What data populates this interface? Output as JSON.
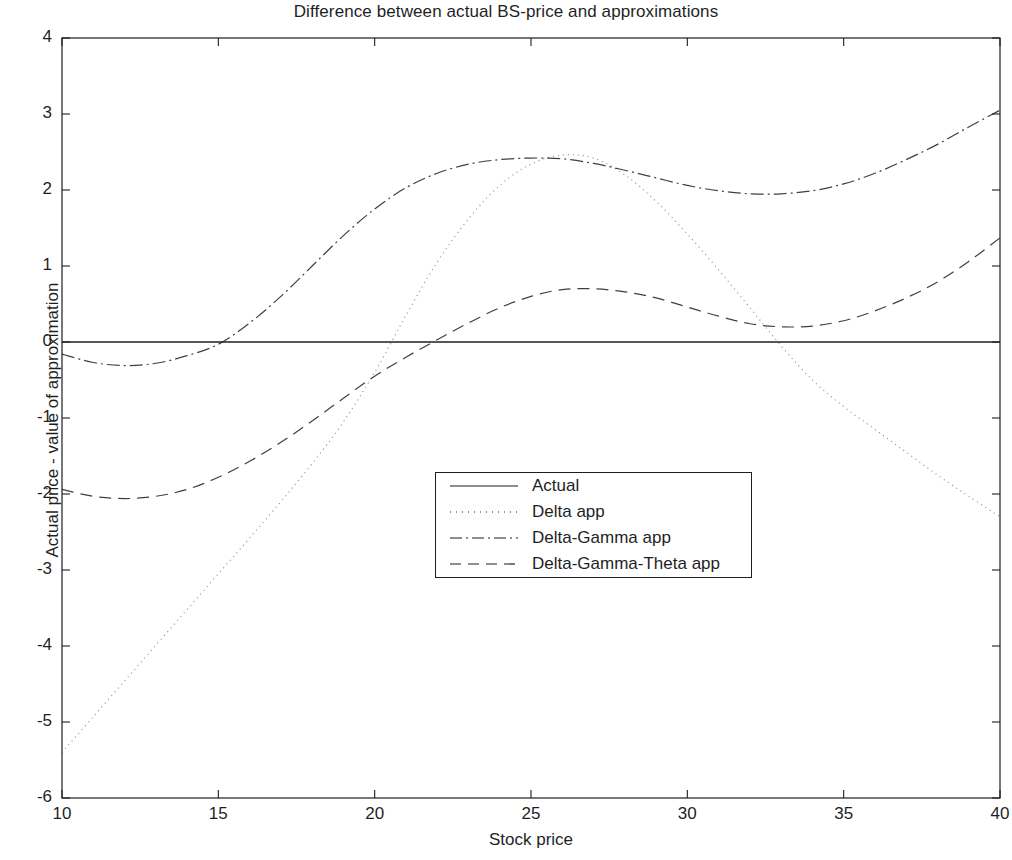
{
  "chart_data": {
    "type": "line",
    "title": "Difference between actual BS-price and approximations",
    "xlabel": "Stock price",
    "ylabel": "Actual price - value of approximation",
    "xlim": [
      10,
      40
    ],
    "ylim": [
      -6,
      4
    ],
    "xticks": [
      10,
      15,
      20,
      25,
      30,
      35,
      40
    ],
    "yticks": [
      -6,
      -5,
      -4,
      -3,
      -2,
      -1,
      0,
      1,
      2,
      3,
      4
    ],
    "grid": false,
    "legend_position": "center",
    "x": [
      10,
      11,
      12,
      13,
      14,
      15,
      16,
      17,
      18,
      19,
      20,
      21,
      22,
      23,
      24,
      25,
      26,
      27,
      28,
      29,
      30,
      31,
      32,
      33,
      34,
      35,
      36,
      37,
      38,
      39,
      40
    ],
    "series": [
      {
        "name": "Actual",
        "style": "solid",
        "values": [
          0,
          0,
          0,
          0,
          0,
          0,
          0,
          0,
          0,
          0,
          0,
          0,
          0,
          0,
          0,
          0,
          0,
          0,
          0,
          0,
          0,
          0,
          0,
          0,
          0,
          0,
          0,
          0,
          0,
          0,
          0
        ]
      },
      {
        "name": "Delta app",
        "style": "dotted",
        "values": [
          -5.4,
          -4.93,
          -4.46,
          -3.99,
          -3.52,
          -3.05,
          -2.58,
          -2.1,
          -1.6,
          -1.05,
          -0.4,
          0.35,
          1.05,
          1.62,
          2.06,
          2.34,
          2.46,
          2.42,
          2.2,
          1.85,
          1.42,
          0.95,
          0.45,
          -0.05,
          -0.5,
          -0.85,
          -1.15,
          -1.45,
          -1.75,
          -2.03,
          -2.3
        ]
      },
      {
        "name": "Delta-Gamma app",
        "style": "dashdot",
        "values": [
          -0.16,
          -0.27,
          -0.31,
          -0.28,
          -0.18,
          -0.03,
          0.25,
          0.6,
          1.0,
          1.4,
          1.75,
          2.03,
          2.22,
          2.34,
          2.4,
          2.42,
          2.41,
          2.35,
          2.26,
          2.16,
          2.06,
          1.99,
          1.95,
          1.95,
          1.99,
          2.08,
          2.22,
          2.4,
          2.6,
          2.83,
          3.05
        ]
      },
      {
        "name": "Delta-Gamma-Theta app",
        "style": "dashed",
        "values": [
          -1.94,
          -2.03,
          -2.06,
          -2.03,
          -1.94,
          -1.78,
          -1.57,
          -1.32,
          -1.04,
          -0.74,
          -0.45,
          -0.2,
          0.03,
          0.25,
          0.45,
          0.6,
          0.69,
          0.7,
          0.66,
          0.58,
          0.46,
          0.34,
          0.24,
          0.2,
          0.21,
          0.28,
          0.41,
          0.58,
          0.79,
          1.06,
          1.37
        ]
      }
    ]
  },
  "legend": {
    "items": [
      {
        "label": "Actual",
        "style": "solid"
      },
      {
        "label": "Delta app",
        "style": "dotted"
      },
      {
        "label": "Delta-Gamma app",
        "style": "dashdot"
      },
      {
        "label": "Delta-Gamma-Theta app",
        "style": "dashed"
      }
    ]
  },
  "axes": {
    "xtick_labels": [
      "10",
      "15",
      "20",
      "25",
      "30",
      "35",
      "40"
    ],
    "ytick_labels": [
      "4",
      "3",
      "2",
      "1",
      "0",
      "-1",
      "-2",
      "-3",
      "-4",
      "-5",
      "-6"
    ]
  },
  "colors": {
    "line": "#1f1f1f",
    "axis": "#1f1f1f",
    "background": "#ffffff"
  }
}
